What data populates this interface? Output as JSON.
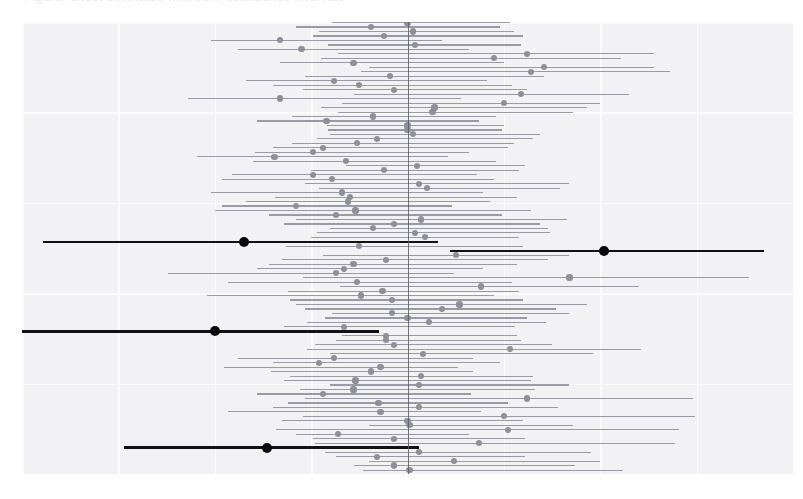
{
  "figure": {
    "kind": "forest-plot",
    "clipped_top_text": "Figure: effect estimates with 95% confidence intervals",
    "background_color": "#f2f2f4",
    "grid_color": "#fbfbfc",
    "zero_line_color": "#5c5c66",
    "ci_color": "#9a9aa4",
    "point_color": "#8f8f99",
    "highlight_color": "#08080a"
  },
  "chart_data": {
    "type": "line",
    "title": "",
    "subtitle": "",
    "xlabel": "",
    "ylabel": "",
    "xlim": [
      -1.0,
      1.0
    ],
    "ylim": [
      0,
      101
    ],
    "grid": true,
    "legend_position": "none",
    "reference_line_x": 0,
    "xticks": [
      -1.0,
      -0.75,
      -0.5,
      -0.25,
      0,
      0.25,
      0.5,
      0.75,
      1.0
    ],
    "xtick_labels": [
      "",
      "",
      "",
      "",
      "",
      "",
      "",
      "",
      ""
    ],
    "yticks": [],
    "ytick_labels": [],
    "annotations": [],
    "series_description": "Point estimate with lower and upper 95% confidence limits for each of 101 study rows; 4 rows are highlighted in black.",
    "columns": [
      "row",
      "estimate",
      "ci_low",
      "ci_high",
      "highlight"
    ],
    "rows": [
      [
        1,
        0.005,
        -0.115,
        0.56,
        false
      ],
      [
        2,
        -0.035,
        -0.14,
        0.435,
        false
      ],
      [
        3,
        0.12,
        -0.1,
        0.5,
        false
      ],
      [
        4,
        -0.08,
        -0.185,
        0.305,
        false
      ],
      [
        5,
        0.03,
        -0.215,
        0.475,
        false
      ],
      [
        6,
        -0.365,
        -0.735,
        0.03,
        true
      ],
      [
        7,
        0.185,
        -0.24,
        0.695,
        false
      ],
      [
        8,
        -0.035,
        -0.245,
        0.305,
        false
      ],
      [
        9,
        -0.18,
        -0.29,
        0.16,
        false
      ],
      [
        10,
        0.26,
        -0.34,
        0.705,
        false
      ],
      [
        11,
        0.005,
        -0.1,
        0.43,
        false
      ],
      [
        12,
        0.0,
        -0.325,
        0.3,
        false
      ],
      [
        13,
        0.25,
        -0.27,
        0.745,
        false
      ],
      [
        14,
        -0.07,
        -0.465,
        0.19,
        false
      ],
      [
        15,
        0.03,
        -0.35,
        0.39,
        false
      ],
      [
        16,
        -0.075,
        -0.31,
        0.26,
        false
      ],
      [
        17,
        0.31,
        -0.265,
        0.74,
        false
      ],
      [
        18,
        -0.22,
        -0.39,
        0.165,
        false
      ],
      [
        19,
        -0.14,
        -0.28,
        0.33,
        false
      ],
      [
        20,
        0.03,
        -0.2,
        0.42,
        false
      ],
      [
        21,
        -0.135,
        -0.32,
        0.32,
        false
      ],
      [
        22,
        0.035,
        -0.305,
        0.325,
        false
      ],
      [
        23,
        -0.095,
        -0.355,
        0.17,
        false
      ],
      [
        24,
        -0.07,
        -0.475,
        0.13,
        false
      ],
      [
        25,
        -0.23,
        -0.35,
        0.24,
        false
      ],
      [
        26,
        -0.19,
        -0.44,
        0.17,
        false
      ],
      [
        27,
        0.04,
        -0.2,
        0.48,
        false
      ],
      [
        28,
        0.265,
        -0.26,
        0.605,
        false
      ],
      [
        29,
        -0.035,
        -0.24,
        0.375,
        false
      ],
      [
        30,
        -0.055,
        -0.185,
        0.295,
        false
      ],
      [
        31,
        -0.055,
        -0.17,
        0.285,
        false
      ],
      [
        32,
        -0.5,
        -1.0,
        -0.075,
        true
      ],
      [
        33,
        -0.165,
        -0.32,
        0.28,
        false
      ],
      [
        34,
        0.055,
        -0.26,
        0.36,
        false
      ],
      [
        35,
        0.0,
        -0.215,
        0.31,
        false
      ],
      [
        36,
        -0.04,
        -0.195,
        0.42,
        false
      ],
      [
        37,
        0.09,
        -0.265,
        0.385,
        false
      ],
      [
        38,
        0.135,
        -0.29,
        0.465,
        false
      ],
      [
        39,
        -0.04,
        -0.305,
        0.3,
        false
      ],
      [
        40,
        -0.12,
        -0.52,
        0.225,
        false
      ],
      [
        41,
        -0.065,
        -0.31,
        0.29,
        false
      ],
      [
        42,
        0.19,
        -0.175,
        0.6,
        false
      ],
      [
        43,
        -0.13,
        -0.465,
        0.27,
        false
      ],
      [
        44,
        0.42,
        -0.27,
        0.885,
        false
      ],
      [
        45,
        -0.185,
        -0.62,
        0.12,
        false
      ],
      [
        46,
        -0.165,
        -0.39,
        0.195,
        false
      ],
      [
        47,
        -0.14,
        -0.36,
        0.285,
        false
      ],
      [
        48,
        -0.055,
        -0.325,
        0.365,
        false
      ],
      [
        49,
        0.125,
        -0.22,
        0.42,
        false
      ],
      [
        50,
        0.51,
        0.11,
        0.925,
        true
      ],
      [
        51,
        -0.125,
        -0.315,
        0.3,
        false
      ],
      [
        52,
        -0.425,
        -0.945,
        0.08,
        true
      ],
      [
        53,
        0.045,
        -0.25,
        0.29,
        false
      ],
      [
        54,
        0.02,
        -0.235,
        0.37,
        false
      ],
      [
        55,
        -0.09,
        -0.2,
        0.365,
        false
      ],
      [
        56,
        -0.035,
        -0.32,
        0.345,
        false
      ],
      [
        57,
        0.035,
        -0.29,
        0.415,
        false
      ],
      [
        58,
        -0.185,
        -0.36,
        0.245,
        false
      ],
      [
        59,
        -0.135,
        -0.5,
        0.32,
        false
      ],
      [
        60,
        -0.29,
        -0.48,
        0.115,
        false
      ],
      [
        61,
        -0.155,
        -0.42,
        0.215,
        false
      ],
      [
        62,
        -0.15,
        -0.345,
        0.285,
        false
      ],
      [
        63,
        -0.17,
        -0.51,
        0.195,
        false
      ],
      [
        64,
        0.05,
        -0.23,
        0.395,
        false
      ],
      [
        65,
        0.03,
        -0.265,
        0.42,
        false
      ],
      [
        66,
        -0.195,
        -0.48,
        0.225,
        false
      ],
      [
        67,
        -0.245,
        -0.455,
        0.18,
        false
      ],
      [
        68,
        -0.06,
        -0.25,
        0.29,
        false
      ],
      [
        69,
        0.025,
        -0.16,
        0.305,
        false
      ],
      [
        70,
        -0.16,
        -0.4,
        0.23,
        false
      ],
      [
        71,
        -0.345,
        -0.545,
        0.105,
        false
      ],
      [
        72,
        -0.245,
        -0.395,
        0.16,
        false
      ],
      [
        73,
        -0.22,
        -0.35,
        0.26,
        false
      ],
      [
        74,
        -0.13,
        -0.3,
        0.275,
        false
      ],
      [
        75,
        -0.08,
        -0.235,
        0.325,
        false
      ],
      [
        76,
        0.015,
        -0.2,
        0.345,
        false
      ],
      [
        77,
        0.0,
        -0.205,
        0.245,
        false
      ],
      [
        78,
        0.0,
        -0.21,
        0.25,
        false
      ],
      [
        79,
        -0.21,
        -0.39,
        0.185,
        false
      ],
      [
        80,
        -0.09,
        -0.3,
        0.23,
        false
      ],
      [
        81,
        0.065,
        -0.18,
        0.43,
        false
      ],
      [
        82,
        0.07,
        -0.225,
        0.465,
        false
      ],
      [
        83,
        0.25,
        -0.17,
        0.5,
        false
      ],
      [
        84,
        -0.33,
        -0.57,
        0.14,
        false
      ],
      [
        85,
        0.295,
        -0.14,
        0.575,
        false
      ],
      [
        86,
        -0.035,
        -0.27,
        0.31,
        false
      ],
      [
        87,
        -0.125,
        -0.35,
        0.27,
        false
      ],
      [
        88,
        -0.19,
        -0.42,
        0.205,
        false
      ],
      [
        89,
        -0.045,
        -0.265,
        0.355,
        false
      ],
      [
        90,
        0.32,
        -0.12,
        0.68,
        false
      ],
      [
        91,
        0.355,
        -0.1,
        0.64,
        false
      ],
      [
        92,
        -0.14,
        -0.33,
        0.25,
        false
      ],
      [
        93,
        0.225,
        -0.225,
        0.555,
        false
      ],
      [
        94,
        0.31,
        -0.18,
        0.64,
        false
      ],
      [
        95,
        -0.275,
        -0.44,
        0.16,
        false
      ],
      [
        96,
        0.02,
        -0.205,
        0.295,
        false
      ],
      [
        97,
        -0.33,
        -0.51,
        0.09,
        false
      ],
      [
        98,
        -0.06,
        -0.245,
        0.3,
        false
      ],
      [
        99,
        0.015,
        -0.23,
        0.275,
        false
      ],
      [
        100,
        -0.095,
        -0.29,
        0.24,
        false
      ],
      [
        101,
        0.0,
        -0.195,
        0.265,
        false
      ]
    ]
  }
}
